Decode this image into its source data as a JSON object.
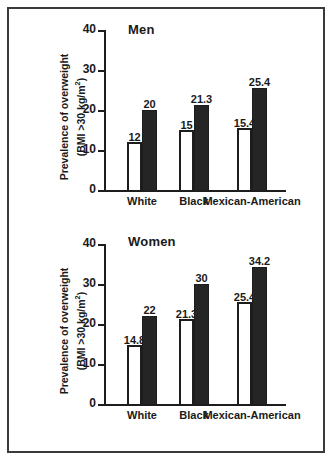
{
  "figure": {
    "background": "#ffffff",
    "frame_color": "#3a3a3a",
    "bar_open_color": "#ffffff",
    "bar_filled_color": "#252525",
    "axis_color": "#1d1d1d"
  },
  "chart_data": [
    {
      "type": "bar",
      "title": "Men",
      "xlabel": "",
      "ylabel": "Prevalence of overweight (BMI >30 kg/m²)",
      "ylabel_line1": "Prevalence of overweight",
      "ylabel_line2_pre": "(BMI >30 kg/m",
      "ylabel_line2_sup": "2",
      "ylabel_line2_post": ")",
      "categories": [
        "White",
        "Black",
        "Mexican-American"
      ],
      "ylim": [
        0,
        40
      ],
      "yticks": [
        0,
        10,
        20,
        30,
        40
      ],
      "ytick_labels": [
        "0",
        "10",
        "20",
        "30",
        "40"
      ],
      "grid": false,
      "legend": false,
      "series": [
        {
          "name": "earlier survey",
          "style": "open",
          "values": [
            12,
            15,
            15.4
          ],
          "labels": [
            "12",
            "15",
            "15.4"
          ]
        },
        {
          "name": "later survey",
          "style": "filled",
          "values": [
            20,
            21.3,
            25.4
          ],
          "labels": [
            "20",
            "21.3",
            "25.4"
          ]
        }
      ]
    },
    {
      "type": "bar",
      "title": "Women",
      "xlabel": "",
      "ylabel": "Prevalence of overweight (BMI >30 kg/m²)",
      "ylabel_line1": "Prevalence of overweight",
      "ylabel_line2_pre": "(BMI >30 kg/m",
      "ylabel_line2_sup": "2",
      "ylabel_line2_post": ")",
      "categories": [
        "White",
        "Black",
        "Mexican-American"
      ],
      "ylim": [
        0,
        40
      ],
      "yticks": [
        0,
        10,
        20,
        30,
        40
      ],
      "ytick_labels": [
        "0",
        "10",
        "20",
        "30",
        "40"
      ],
      "grid": false,
      "legend": false,
      "series": [
        {
          "name": "earlier survey",
          "style": "open",
          "values": [
            14.8,
            21.3,
            25.4
          ],
          "labels": [
            "14.8",
            "21.3",
            "25.4"
          ]
        },
        {
          "name": "later survey",
          "style": "filled",
          "values": [
            22,
            30,
            34.2
          ],
          "labels": [
            "22",
            "30",
            "34.2"
          ]
        }
      ]
    }
  ]
}
